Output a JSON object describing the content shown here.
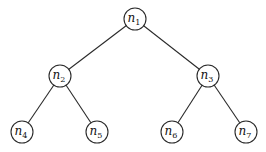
{
  "diagram": {
    "type": "binary-tree",
    "nodes": [
      {
        "id": "n1",
        "base": "n",
        "sub": "1"
      },
      {
        "id": "n2",
        "base": "n",
        "sub": "2"
      },
      {
        "id": "n3",
        "base": "n",
        "sub": "3"
      },
      {
        "id": "n4",
        "base": "n",
        "sub": "4"
      },
      {
        "id": "n5",
        "base": "n",
        "sub": "5"
      },
      {
        "id": "n6",
        "base": "n",
        "sub": "6"
      },
      {
        "id": "n7",
        "base": "n",
        "sub": "7"
      }
    ],
    "edges": [
      [
        "n1",
        "n2"
      ],
      [
        "n1",
        "n3"
      ],
      [
        "n2",
        "n4"
      ],
      [
        "n2",
        "n5"
      ],
      [
        "n3",
        "n6"
      ],
      [
        "n3",
        "n7"
      ]
    ]
  }
}
